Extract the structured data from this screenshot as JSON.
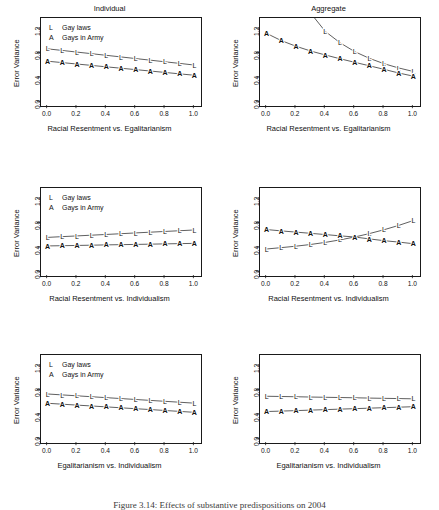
{
  "figure": {
    "width": 439,
    "height": 510,
    "background": "#ffffff",
    "ink": "#1a1a1a",
    "caption": "Figure 3.14: Effects of substantive predispositions on 2004"
  },
  "columns": [
    {
      "id": "individual",
      "title": "Individual"
    },
    {
      "id": "aggregate",
      "title": "Aggregate"
    }
  ],
  "legend": {
    "entries": [
      {
        "key": "L",
        "label": "Gay laws"
      },
      {
        "key": "A",
        "label": "Gays in Army"
      }
    ]
  },
  "axes": {
    "ylabel": "Error Variance",
    "yticks": [
      "0.0",
      "0.4",
      "0.8",
      "1.2"
    ],
    "ytick_values": [
      0.0,
      0.4,
      0.8,
      1.2
    ],
    "ylim": [
      -0.06,
      1.38
    ],
    "xticks": [
      "0.0",
      "0.2",
      "0.4",
      "0.6",
      "0.8",
      "1.0"
    ],
    "xtick_values": [
      0.0,
      0.2,
      0.4,
      0.6,
      0.8,
      1.0
    ],
    "xlim": [
      -0.045,
      1.045
    ]
  },
  "chart_data": [
    {
      "id": "p1",
      "type": "line",
      "title": "Individual",
      "xlabel": "Racial Resentment vs. Egalitarianism",
      "ylabel": "Error Variance",
      "xlim": [
        -0.045,
        1.045
      ],
      "ylim": [
        -0.06,
        1.38
      ],
      "grid": false,
      "legend": "top-left",
      "x": [
        0.0,
        0.1,
        0.2,
        0.3,
        0.4,
        0.5,
        0.6,
        0.7,
        0.8,
        0.9,
        1.0
      ],
      "series": [
        {
          "name": "Gay laws",
          "marker": "L",
          "values": [
            0.875,
            0.849,
            0.822,
            0.796,
            0.769,
            0.743,
            0.716,
            0.69,
            0.663,
            0.637,
            0.61
          ]
        },
        {
          "name": "Gays in Army",
          "marker": "A",
          "values": [
            0.673,
            0.65,
            0.627,
            0.604,
            0.581,
            0.558,
            0.535,
            0.512,
            0.489,
            0.466,
            0.443
          ]
        }
      ]
    },
    {
      "id": "p2",
      "type": "line",
      "title": "Aggregate",
      "xlabel": "Racial Resentment vs. Egalitarianism",
      "ylabel": "Error Variance",
      "xlim": [
        -0.045,
        1.045
      ],
      "ylim": [
        -0.06,
        1.38
      ],
      "grid": false,
      "legend": "none",
      "x": [
        0.0,
        0.1,
        0.2,
        0.3,
        0.4,
        0.5,
        0.6,
        0.7,
        0.8,
        0.9,
        1.0
      ],
      "series": [
        {
          "name": "Gay laws",
          "marker": "L",
          "clipped_above": true,
          "values": [
            3.3,
            2.52,
            1.92,
            1.46,
            1.16,
            0.975,
            0.83,
            0.72,
            0.632,
            0.562,
            0.505
          ]
        },
        {
          "name": "Gays in Army",
          "marker": "A",
          "values": [
            1.128,
            1.01,
            0.918,
            0.84,
            0.775,
            0.713,
            0.655,
            0.598,
            0.54,
            0.48,
            0.428
          ]
        }
      ]
    },
    {
      "id": "p3",
      "type": "line",
      "title": "",
      "xlabel": "Racial Resentment vs. Individualism",
      "ylabel": "Error Variance",
      "xlim": [
        -0.045,
        1.045
      ],
      "ylim": [
        -0.06,
        1.38
      ],
      "grid": false,
      "legend": "top-left",
      "x": [
        0.0,
        0.1,
        0.2,
        0.3,
        0.4,
        0.5,
        0.6,
        0.7,
        0.8,
        0.9,
        1.0
      ],
      "series": [
        {
          "name": "Gay laws",
          "marker": "L",
          "values": [
            0.572,
            0.584,
            0.596,
            0.608,
            0.62,
            0.632,
            0.645,
            0.657,
            0.669,
            0.681,
            0.693
          ]
        },
        {
          "name": "Gays in Army",
          "marker": "A",
          "values": [
            0.432,
            0.436,
            0.44,
            0.444,
            0.449,
            0.453,
            0.457,
            0.461,
            0.466,
            0.47,
            0.474
          ]
        }
      ]
    },
    {
      "id": "p4",
      "type": "line",
      "title": "",
      "xlabel": "Racial Resentment vs. Individualism",
      "ylabel": "Error Variance",
      "xlim": [
        -0.045,
        1.045
      ],
      "ylim": [
        -0.06,
        1.38
      ],
      "grid": false,
      "legend": "none",
      "x": [
        0.0,
        0.1,
        0.2,
        0.3,
        0.4,
        0.5,
        0.6,
        0.7,
        0.8,
        0.9,
        1.0
      ],
      "series": [
        {
          "name": "Gay laws",
          "marker": "L",
          "values": [
            0.382,
            0.404,
            0.428,
            0.456,
            0.49,
            0.531,
            0.578,
            0.634,
            0.697,
            0.768,
            0.848
          ]
        },
        {
          "name": "Gays in Army",
          "marker": "A",
          "values": [
            0.7,
            0.678,
            0.658,
            0.638,
            0.618,
            0.597,
            0.578,
            0.547,
            0.518,
            0.495,
            0.468
          ]
        }
      ]
    },
    {
      "id": "p5",
      "type": "line",
      "title": "",
      "xlabel": "Egalitarianism vs. Individualism",
      "ylabel": "Error Variance",
      "xlim": [
        -0.045,
        1.045
      ],
      "ylim": [
        -0.06,
        1.38
      ],
      "grid": false,
      "legend": "top-left",
      "x": [
        0.0,
        0.1,
        0.2,
        0.3,
        0.4,
        0.5,
        0.6,
        0.7,
        0.8,
        0.9,
        1.0
      ],
      "series": [
        {
          "name": "Gay laws",
          "marker": "L",
          "values": [
            0.742,
            0.727,
            0.712,
            0.697,
            0.682,
            0.667,
            0.652,
            0.637,
            0.622,
            0.607,
            0.592
          ]
        },
        {
          "name": "Gays in Army",
          "marker": "A",
          "values": [
            0.59,
            0.575,
            0.56,
            0.546,
            0.531,
            0.516,
            0.501,
            0.487,
            0.472,
            0.457,
            0.442
          ]
        }
      ]
    },
    {
      "id": "p6",
      "type": "line",
      "title": "",
      "xlabel": "Egalitarianism vs. Individualism",
      "ylabel": "Error Variance",
      "xlim": [
        -0.045,
        1.045
      ],
      "ylim": [
        -0.06,
        1.38
      ],
      "grid": false,
      "legend": "none",
      "x": [
        0.0,
        0.1,
        0.2,
        0.3,
        0.4,
        0.5,
        0.6,
        0.7,
        0.8,
        0.9,
        1.0
      ],
      "series": [
        {
          "name": "Gay laws",
          "marker": "L",
          "values": [
            0.705,
            0.701,
            0.697,
            0.692,
            0.688,
            0.684,
            0.68,
            0.675,
            0.671,
            0.667,
            0.663
          ]
        },
        {
          "name": "Gays in Army",
          "marker": "A",
          "values": [
            0.455,
            0.462,
            0.47,
            0.478,
            0.486,
            0.494,
            0.502,
            0.51,
            0.518,
            0.526,
            0.534
          ]
        }
      ]
    }
  ]
}
